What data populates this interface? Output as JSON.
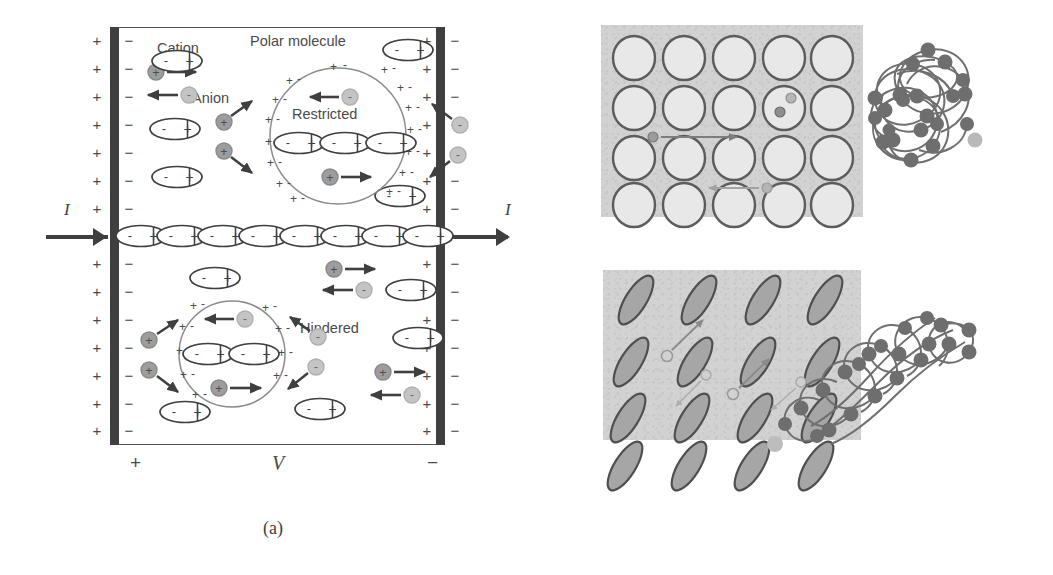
{
  "figure": {
    "captions": {
      "a": "(a)",
      "b": "(b)"
    }
  },
  "panel_a": {
    "name": "electrochemical-cell-schematic",
    "labels": {
      "cation": "Cation",
      "anion": "Anion",
      "polar_molecule": "Polar molecule",
      "restricted": "Restricted",
      "hindered": "Hindered"
    },
    "current_label_left": "I",
    "current_label_right": "I",
    "polarity": {
      "left_terminal": "+",
      "voltage": "V",
      "right_terminal": "−"
    },
    "electrode_signs": {
      "left_outer": "+",
      "left_inner": "−",
      "right_inner": "+",
      "right_outer": "−",
      "rows_per_column": 14
    },
    "species": {
      "cation_symbol": "+",
      "anion_symbol": "−",
      "polar_molecule_negative_end": "-",
      "polar_molecule_positive_end": "+"
    },
    "domains": {
      "restricted": {
        "label": "Restricted",
        "molecules_in_chain": 3,
        "boundary_charge_pairs": 12
      },
      "hindered": {
        "label": "Hindered",
        "molecules_in_chain": 2,
        "boundary_charge_pairs": 8
      }
    },
    "center_chain_molecule_count": 8,
    "colors": {
      "electrode": "#3f3f3f",
      "frame": "#555555",
      "cation": "#9a9a9a",
      "anion": "#bdbdbd",
      "text": "#4a4a4a",
      "arrow": "#3f3f3f"
    }
  },
  "panel_b": {
    "name": "microstructure-and-polymer-coils",
    "top_grid": {
      "name": "isotropic-spherical-particle-lattice",
      "columns": 5,
      "rows": 4,
      "shape": "circle",
      "background_color": "#d2d2d2",
      "particle_fill": "#e6e6e6",
      "particle_stroke": "#5a5a5a",
      "ion_tracks": 2
    },
    "bottom_grid": {
      "name": "anisotropic-tilted-ellipse-lattice",
      "columns": 4,
      "rows": 4,
      "shape": "tilted-ellipse",
      "tilt_degrees": -58,
      "background_color": "#d2d2d2",
      "particle_fill": "#a8a8a8",
      "particle_stroke": "#4f4f4f",
      "ion_tracks": 4
    },
    "top_coil": {
      "name": "globular-polymer-coil",
      "node_count": 22,
      "node_color": "#6e6e6e",
      "strand_color": "#707070",
      "shape": "isotropic-globule"
    },
    "bottom_coil": {
      "name": "elongated-polymer-coil",
      "node_count": 18,
      "node_color": "#6e6e6e",
      "strand_color": "#707070",
      "shape": "stretched-diagonal"
    }
  }
}
